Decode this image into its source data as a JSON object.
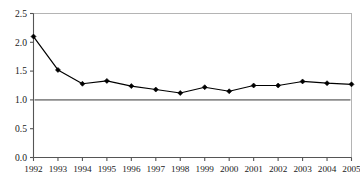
{
  "chart_data": {
    "type": "line",
    "title": "",
    "subtitle": "",
    "xlabel": "",
    "ylabel": "",
    "categories": [
      "1992",
      "1993",
      "1994",
      "1995",
      "1996",
      "1997",
      "1998",
      "1999",
      "2000",
      "2001",
      "2002",
      "2003",
      "2004",
      "2005"
    ],
    "x": [
      1992,
      1993,
      1994,
      1995,
      1996,
      1997,
      1998,
      1999,
      2000,
      2001,
      2002,
      2003,
      2004,
      2005
    ],
    "values": [
      2.1,
      1.52,
      1.28,
      1.33,
      1.24,
      1.18,
      1.12,
      1.22,
      1.15,
      1.25,
      1.25,
      1.32,
      1.29,
      1.27
    ],
    "series": [
      {
        "name": "",
        "values": [
          2.1,
          1.52,
          1.28,
          1.33,
          1.24,
          1.18,
          1.12,
          1.22,
          1.15,
          1.25,
          1.25,
          1.32,
          1.29,
          1.27
        ],
        "color": "#000000",
        "marker": "diamond"
      }
    ],
    "ylim": [
      0.0,
      2.5
    ],
    "yticks": [
      0.0,
      0.5,
      1.0,
      1.5,
      2.0,
      2.5
    ],
    "ytick_labels": [
      "0.0",
      "0.5",
      "1.0",
      "1.5",
      "2.0",
      "2.5"
    ],
    "xtick_labels": [
      "1992",
      "1993",
      "1994",
      "1995",
      "1996",
      "1997",
      "1998",
      "1999",
      "2000",
      "2001",
      "2002",
      "2003",
      "2004",
      "2005"
    ],
    "grid": false,
    "legend": "none",
    "reference_lines": [
      {
        "name": "baseline",
        "orientation": "horizontal",
        "value": 1.0,
        "color": "#8c8c8c",
        "label": ""
      }
    ],
    "plot_border": true,
    "colors": {
      "line": "#000000",
      "marker": "#000000",
      "reference_line": "#8c8c8c",
      "axis": "#555555",
      "plot_border": "#b4b4b4",
      "background": "#ffffff",
      "tick_text": "#1a1a1a"
    }
  }
}
